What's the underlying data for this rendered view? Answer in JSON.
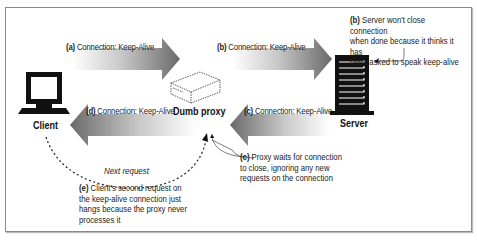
{
  "diagram": {
    "nodes": {
      "client": {
        "label": "Client",
        "icon": "monitor-icon"
      },
      "proxy": {
        "label": "Dumb proxy",
        "icon": "proxy-box-icon"
      },
      "server": {
        "label": "Server",
        "icon": "server-tower-icon"
      }
    },
    "arrows": [
      {
        "id": "a",
        "tag": "(a)",
        "text": "Connection: Keep-Alive",
        "from": "client",
        "to": "proxy"
      },
      {
        "id": "b",
        "tag": "(b)",
        "text": "Connection: Keep-Alive",
        "from": "proxy",
        "to": "server"
      },
      {
        "id": "c",
        "tag": "(c)",
        "text": "Connection: Keep-Alive",
        "from": "server",
        "to": "proxy"
      },
      {
        "id": "d",
        "tag": "(d)",
        "text": "Connection: Keep-Alive",
        "from": "proxy",
        "to": "client"
      }
    ],
    "notes": {
      "b": {
        "tag": "(b)",
        "line1": "Server won't close connection",
        "line2": "when done because it thinks it has",
        "line3": "been asked to speak keep-alive"
      },
      "c": {
        "tag": "(c)",
        "line1": "Proxy waits for connection",
        "line2": "to close, ignoring any new",
        "line3": "requests on the connection"
      },
      "e": {
        "tag": "(e)",
        "line1": "Client's second request on",
        "line2": "the keep-alive connection just",
        "line3": "hangs because the proxy never",
        "line4": "processes it"
      }
    },
    "next_request_label": "Next request",
    "colors": {
      "arrow_dark": "#6e6e6e",
      "arrow_light": "#ffffff",
      "ink": "#111111",
      "frame": "#8a8a8a"
    }
  }
}
